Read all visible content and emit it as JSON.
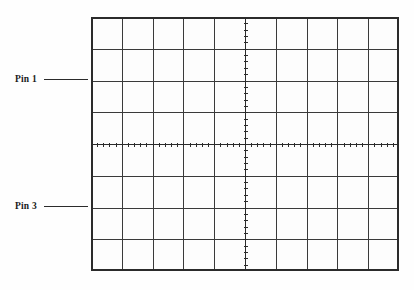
{
  "figure": {
    "type": "oscilloscope-graticule",
    "background_color": "#fefefe",
    "line_color": "#2b2b2b"
  },
  "graticule": {
    "name": "oscilloscope-graticule",
    "columns": 10,
    "rows": 8,
    "x": 91,
    "y": 17,
    "width": 308,
    "height": 254,
    "cell_width": 30.8,
    "cell_height": 31.75,
    "border_color": "#2b2b2b",
    "grid_color": "#3a3a3a",
    "grid_line_width": 1.1,
    "border_line_width": 1.6,
    "center_axis": {
      "horizontal_y_row": 4,
      "vertical_x_column": 5,
      "ticks_per_cell": 5,
      "tick_length": 4,
      "tick_color": "#2b2b2b",
      "tick_line_width": 1.2
    }
  },
  "annotations": [
    {
      "id": "pin-1",
      "label": "Pin 1",
      "leader_length": 44,
      "attaches_to_row": 2,
      "x": 15,
      "y": 79
    },
    {
      "id": "pin-3",
      "label": "Pin 3",
      "leader_length": 44,
      "attaches_to_row": 6,
      "x": 15,
      "y": 202
    }
  ]
}
